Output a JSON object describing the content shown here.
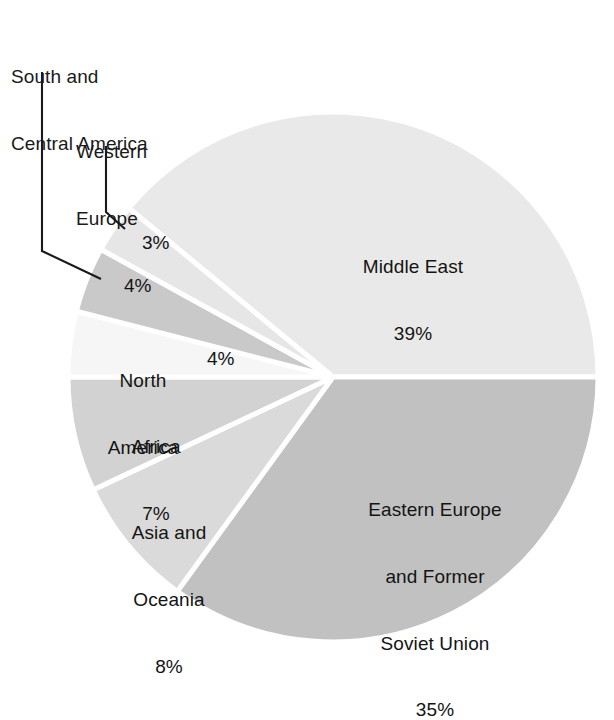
{
  "figure": {
    "background_color": "#ffffff",
    "caption_fragment": ""
  },
  "chart_data": {
    "type": "pie",
    "title": "",
    "subtitle": "",
    "xlabel": "",
    "ylabel": "",
    "grid": false,
    "legend_position": "none",
    "label_format": "name + percent",
    "start_angle_deg": 0,
    "direction": "clockwise",
    "total_percent": 100,
    "center": {
      "x": 333,
      "y": 377
    },
    "radius": 265,
    "categories": [
      "Middle East",
      "Eastern Europe and Former Soviet Union",
      "Asia and Oceania",
      "Africa",
      "North America",
      "South and Central America",
      "Western Europe"
    ],
    "values": [
      39,
      35,
      8,
      7,
      4,
      4,
      3
    ],
    "slices": [
      {
        "name": "Middle East",
        "value": 39,
        "percent_label": "39%",
        "label_lines": [
          "Middle East",
          "39%"
        ],
        "label_placement": "inside",
        "color": "#e9e9e9",
        "start_angle_deg": 0,
        "end_angle_deg": 140.4
      },
      {
        "name": "Eastern Europe and Former Soviet Union",
        "value": 35,
        "percent_label": "35%",
        "label_lines": [
          "Eastern Europe",
          "and Former",
          "Soviet Union",
          "35%"
        ],
        "label_placement": "inside",
        "color": "#c1c1c1",
        "start_angle_deg": 0,
        "end_angle_deg": -126.0
      },
      {
        "name": "Asia and Oceania",
        "value": 8,
        "percent_label": "8%",
        "label_lines": [
          "Asia and",
          "Oceania",
          "8%"
        ],
        "label_placement": "inside",
        "color": "#dadada",
        "start_angle_deg": -126.0,
        "end_angle_deg": -154.8
      },
      {
        "name": "Africa",
        "value": 7,
        "percent_label": "7%",
        "label_lines": [
          "Africa",
          "7%"
        ],
        "label_placement": "inside",
        "color": "#d2d2d2",
        "start_angle_deg": -154.8,
        "end_angle_deg": -180.0
      },
      {
        "name": "North America",
        "value": 4,
        "percent_label": "4%",
        "label_lines": [
          "North",
          "America"
        ],
        "label_placement": "inside",
        "color": "#f6f6f6",
        "start_angle_deg": 180.0,
        "end_angle_deg": 165.6
      },
      {
        "name": "South and Central America",
        "value": 4,
        "percent_label": "4%",
        "label_lines": [
          "South and",
          "Central America"
        ],
        "label_placement": "outside-leader",
        "color": "#c9c9c9",
        "start_angle_deg": 165.6,
        "end_angle_deg": 151.2
      },
      {
        "name": "Western Europe",
        "value": 3,
        "percent_label": "3%",
        "label_lines": [
          "Western",
          "Europe"
        ],
        "label_placement": "outside-leader",
        "color": "#e6e6e6",
        "start_angle_deg": 151.2,
        "end_angle_deg": 140.4
      }
    ],
    "annotations": [
      {
        "text": "South and Central America",
        "type": "leader-label"
      },
      {
        "text": "Western Europe",
        "type": "leader-label"
      }
    ]
  },
  "labels": {
    "middle_east": {
      "line1": "Middle East",
      "line2": "39%"
    },
    "eastern_europe": {
      "line1": "Eastern Europe",
      "line2": "and Former",
      "line3": "Soviet Union",
      "line4": "35%"
    },
    "asia_oceania": {
      "line1": "Asia and",
      "line2": "Oceania",
      "line3": "8%"
    },
    "africa": {
      "line1": "Africa",
      "line2": "7%"
    },
    "north_america": {
      "line1": "North",
      "line2": "America",
      "pct": "4%"
    },
    "south_central_america": {
      "line1": "South and",
      "line2": "Central America",
      "pct": "4%"
    },
    "western_europe": {
      "line1": "Western",
      "line2": "Europe",
      "pct": "3%"
    }
  }
}
